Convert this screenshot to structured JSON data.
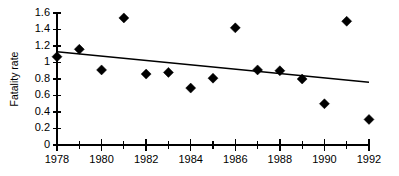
{
  "chart_data": {
    "type": "scatter",
    "title": "",
    "xlabel": "",
    "ylabel": "Fatality rate",
    "xlim": [
      1978,
      1992
    ],
    "ylim": [
      0,
      1.6
    ],
    "grid": false,
    "legend": "none",
    "x_ticks": [
      1978,
      1980,
      1982,
      1984,
      1986,
      1988,
      1990,
      1992
    ],
    "x_tick_labels": [
      "1978",
      "1980",
      "1982",
      "1984",
      "1986",
      "1988",
      "1990",
      "1992"
    ],
    "x_minor_ticks": [
      1979,
      1981,
      1983,
      1985,
      1987,
      1989,
      1991
    ],
    "y_ticks": [
      0,
      0.2,
      0.4,
      0.6,
      0.8,
      1.0,
      1.2,
      1.4,
      1.6
    ],
    "y_tick_labels": [
      "0",
      "0.2",
      "0.4",
      "0.6",
      "0.8",
      "1",
      "1.2",
      "1.4",
      "1.6"
    ],
    "x": [
      1978,
      1979,
      1980,
      1981,
      1982,
      1983,
      1984,
      1985,
      1986,
      1987,
      1988,
      1989,
      1990,
      1991,
      1992
    ],
    "values": [
      1.07,
      1.16,
      0.91,
      1.54,
      0.86,
      0.88,
      0.69,
      0.81,
      1.42,
      0.91,
      0.9,
      0.8,
      0.5,
      1.5,
      0.31
    ],
    "series": [
      {
        "name": "Fatality rate",
        "marker": "diamond",
        "color": "#000000",
        "x": [
          1978,
          1979,
          1980,
          1981,
          1982,
          1983,
          1984,
          1985,
          1986,
          1987,
          1988,
          1989,
          1990,
          1991,
          1992
        ],
        "values": [
          1.07,
          1.16,
          0.91,
          1.54,
          0.86,
          0.88,
          0.69,
          0.81,
          1.42,
          0.91,
          0.9,
          0.8,
          0.5,
          1.5,
          0.31
        ]
      },
      {
        "name": "Linear trend",
        "marker": "none",
        "color": "#000000",
        "x": [
          1978,
          1992
        ],
        "values": [
          1.13,
          0.76
        ]
      }
    ],
    "annotations": []
  },
  "colors": {
    "axis": "#000000",
    "marker": "#000000",
    "trend": "#000000",
    "background": "#ffffff"
  }
}
